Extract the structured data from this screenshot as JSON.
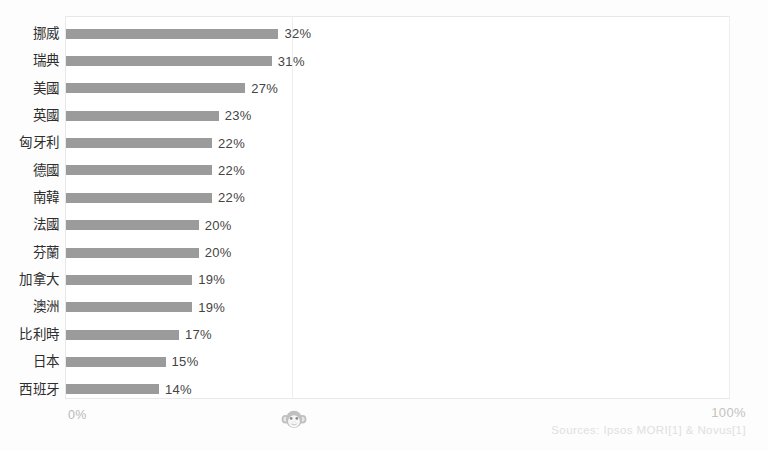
{
  "chart_data": {
    "type": "bar",
    "orientation": "horizontal",
    "title": "",
    "subtitle": "",
    "xlabel": "",
    "ylabel": "",
    "xlim": [
      0,
      100
    ],
    "xtick_labels": [
      "0%",
      "100%"
    ],
    "grid": true,
    "gridline_at": 50,
    "legend": "none",
    "bar_color": "#9b9b9b",
    "categories": [
      "挪威",
      "瑞典",
      "美國",
      "英國",
      "匈牙利",
      "德國",
      "南韓",
      "法國",
      "芬蘭",
      "加拿大",
      "澳洲",
      "比利時",
      "日本",
      "西班牙"
    ],
    "values": [
      32,
      31,
      27,
      23,
      22,
      22,
      22,
      20,
      20,
      19,
      19,
      17,
      15,
      14
    ],
    "value_labels": [
      "32%",
      "31%",
      "27%",
      "23%",
      "22%",
      "22%",
      "22%",
      "20%",
      "20%",
      "19%",
      "19%",
      "17%",
      "15%",
      "14%"
    ],
    "bars": [
      {
        "category": "挪威",
        "value": 32,
        "label": "32%"
      },
      {
        "category": "瑞典",
        "value": 31,
        "label": "31%"
      },
      {
        "category": "美國",
        "value": 27,
        "label": "27%"
      },
      {
        "category": "英國",
        "value": 23,
        "label": "23%"
      },
      {
        "category": "匈牙利",
        "value": 22,
        "label": "22%"
      },
      {
        "category": "德國",
        "value": 22,
        "label": "22%"
      },
      {
        "category": "南韓",
        "value": 22,
        "label": "22%"
      },
      {
        "category": "法國",
        "value": 20,
        "label": "20%"
      },
      {
        "category": "芬蘭",
        "value": 20,
        "label": "20%"
      },
      {
        "category": "加拿大",
        "value": 19,
        "label": "19%"
      },
      {
        "category": "澳洲",
        "value": 19,
        "label": "19%"
      },
      {
        "category": "比利時",
        "value": 17,
        "label": "17%"
      },
      {
        "category": "日本",
        "value": 15,
        "label": "15%"
      },
      {
        "category": "西班牙",
        "value": 14,
        "label": "14%"
      }
    ]
  },
  "axis": {
    "min_label": "0%",
    "max_label": "100%"
  },
  "footer": {
    "source": "Sources: Ipsos MORI[1] & Novus[1]"
  },
  "watermark": {
    "icon": "monkey-face-icon"
  },
  "colors": {
    "bar": "#9b9b9b",
    "value_text": "#444444",
    "category_text": "#2e2e2e",
    "axis_text": "#bdbdbd",
    "source_text": "#e0e0e0",
    "frame": "#e8e8e8",
    "gridline": "#ededed",
    "background": "#fdfdfd"
  }
}
